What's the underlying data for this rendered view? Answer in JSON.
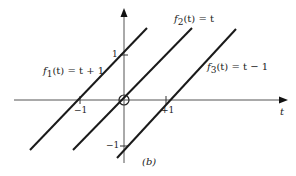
{
  "figure": {
    "caption": "(b)",
    "axis": {
      "horizontal_label": "t",
      "ticks": {
        "t_minus_1": "−1",
        "t_plus_1": "+1",
        "y_plus_1": "1",
        "y_minus_1": "−1"
      }
    },
    "functions": [
      {
        "name": "f1",
        "label_fn": "f",
        "label_sub": "1",
        "label_rest": "(t) = t + 1"
      },
      {
        "name": "f2",
        "label_fn": "f",
        "label_sub": "2",
        "label_rest": "(t) = t"
      },
      {
        "name": "f3",
        "label_fn": "f",
        "label_sub": "3",
        "label_rest": "(t) = t − 1"
      }
    ],
    "colors": {
      "axis": "#555555",
      "line": "#1a1a1a",
      "text": "#222222"
    }
  }
}
